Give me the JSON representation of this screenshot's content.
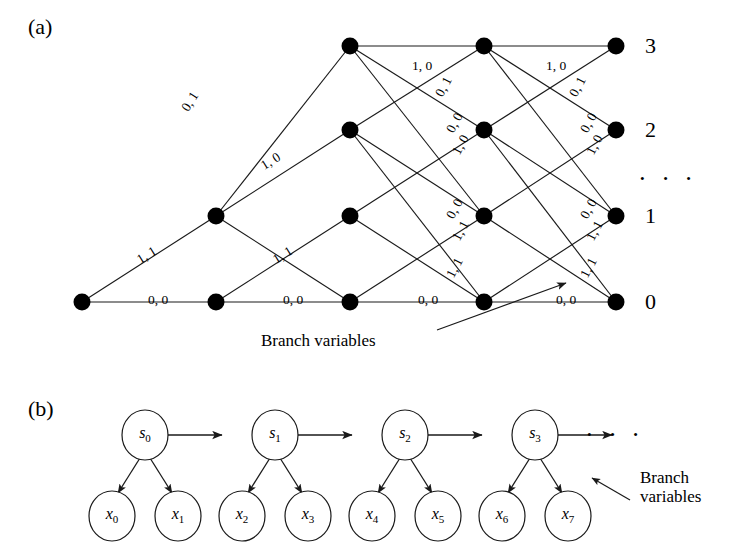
{
  "figure": {
    "panel_a_label": "(a)",
    "panel_b_label": "(b)",
    "ellipsis": "· · ·"
  },
  "panel_a": {
    "caption_label": "(a)",
    "level_labels": [
      "0",
      "1",
      "2",
      "3"
    ],
    "level_label_3": "3",
    "level_label_2": "2",
    "level_label_1": "1",
    "level_label_0": "0",
    "right_ellipsis": "· · ·",
    "annotation": "Branch variables",
    "node_columns": 5,
    "node_levels": 4,
    "edge_labels": {
      "bottom_00_a": "0, 0",
      "bottom_00_b": "0, 0",
      "bottom_00_c": "0, 0",
      "bottom_00_d": "0, 0",
      "diag_11_a": "1, 1",
      "diag_11_b": "1, 1",
      "diag_11_c": "1, 1",
      "diag_11_d": "1, 1",
      "diag_10_a": "1, 0",
      "diag_10_b": "1, 0",
      "diag_10_c": "1, 0",
      "top_10_a": "1, 0",
      "top_10_b": "1, 0",
      "diag_01_a": "0, 1",
      "diag_01_b": "0, 1",
      "diag_01_c": "0, 1",
      "diag_00_a": "0, 0",
      "diag_00_b": "0, 0",
      "drop_01_a": "0, 1",
      "drop_01_b": "0, 1",
      "drop_01_c": "0, 1"
    },
    "edges": [
      {
        "label": "0, 1",
        "x": 178,
        "y": 106,
        "rot": -58
      },
      {
        "label": "1, 0",
        "x": 258,
        "y": 160,
        "rot": -32
      },
      {
        "label": "1, 1",
        "x": 134,
        "y": 254,
        "rot": -32
      },
      {
        "label": "0, 0",
        "x": 148,
        "y": 292,
        "rot": 0
      },
      {
        "label": "1, 0",
        "x": 412,
        "y": 58,
        "rot": 0
      },
      {
        "label": "0, 1",
        "x": 432,
        "y": 92,
        "rot": -62
      },
      {
        "label": "0, 0",
        "x": 443,
        "y": 128,
        "rot": -62
      },
      {
        "label": "1, 0",
        "x": 449,
        "y": 150,
        "rot": -62
      },
      {
        "label": "1, 1",
        "x": 270,
        "y": 254,
        "rot": -32
      },
      {
        "label": "0, 0",
        "x": 283,
        "y": 292,
        "rot": 0
      },
      {
        "label": "1, 0",
        "x": 546,
        "y": 58,
        "rot": 0
      },
      {
        "label": "0, 1",
        "x": 566,
        "y": 92,
        "rot": -62
      },
      {
        "label": "0, 0",
        "x": 577,
        "y": 128,
        "rot": -62
      },
      {
        "label": "1, 0",
        "x": 583,
        "y": 150,
        "rot": -62
      },
      {
        "label": "0, 0",
        "x": 443,
        "y": 214,
        "rot": -62
      },
      {
        "label": "1, 1",
        "x": 449,
        "y": 236,
        "rot": -62
      },
      {
        "label": "1, 1",
        "x": 443,
        "y": 273,
        "rot": -62
      },
      {
        "label": "0, 0",
        "x": 418,
        "y": 292,
        "rot": 0
      },
      {
        "label": "0, 0",
        "x": 577,
        "y": 214,
        "rot": -62
      },
      {
        "label": "1, 1",
        "x": 583,
        "y": 236,
        "rot": -62
      },
      {
        "label": "1, 1",
        "x": 577,
        "y": 273,
        "rot": -62
      },
      {
        "label": "0, 0",
        "x": 556,
        "y": 292,
        "rot": 0
      }
    ]
  },
  "panel_b": {
    "caption_label": "(b)",
    "states": [
      "s0",
      "s1",
      "s2",
      "s3"
    ],
    "state_base": "s",
    "state_subs": [
      "0",
      "1",
      "2",
      "3"
    ],
    "observations": [
      "x0",
      "x1",
      "x2",
      "x3",
      "x4",
      "x5",
      "x6",
      "x7"
    ],
    "obs_base": "x",
    "obs_subs": [
      "0",
      "1",
      "2",
      "3",
      "4",
      "5",
      "6",
      "7"
    ],
    "right_ellipsis": "· · ·",
    "annotation_line1": "Branch",
    "annotation_line2": "variables"
  },
  "colors": {
    "ink": "#000000",
    "line": "#1a1a1a",
    "background": "#ffffff"
  }
}
